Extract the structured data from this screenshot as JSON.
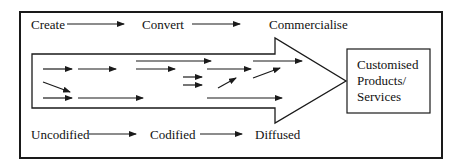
{
  "diagram": {
    "top_flow": [
      "Create",
      "Convert",
      "Commercialise"
    ],
    "bottom_flow": [
      "Uncodified",
      "Codified",
      "Diffused"
    ],
    "output_box": {
      "lines": [
        "Customised",
        "Products/",
        "Services"
      ]
    },
    "colors": {
      "stroke": "#1a1a1a",
      "background": "#ffffff"
    }
  }
}
